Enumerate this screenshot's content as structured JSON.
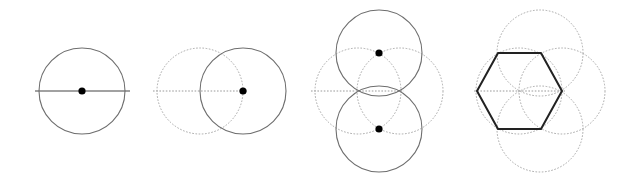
{
  "diagram": {
    "title": "",
    "colors": {
      "solid": "#6e6e6e",
      "dotted": "#a8a8a8",
      "dot": "#000000",
      "hexagon": "#222222"
    },
    "radius": 43,
    "steps": [
      {
        "id": 1,
        "circles": [
          {
            "cx": 82,
            "cy": 91,
            "style": "solid"
          }
        ],
        "lines": [
          {
            "x1": 35,
            "y1": 91,
            "x2": 130,
            "y2": 91,
            "style": "solid"
          }
        ],
        "points": [
          {
            "cx": 82,
            "cy": 91
          }
        ]
      },
      {
        "id": 2,
        "circles": [
          {
            "cx": 200,
            "cy": 91,
            "style": "dotted"
          },
          {
            "cx": 243,
            "cy": 91,
            "style": "solid"
          }
        ],
        "lines": [
          {
            "x1": 153,
            "y1": 91,
            "x2": 247,
            "y2": 91,
            "style": "dotted"
          }
        ],
        "points": [
          {
            "cx": 243,
            "cy": 91
          }
        ]
      },
      {
        "id": 3,
        "circles": [
          {
            "cx": 358,
            "cy": 91,
            "style": "dotted"
          },
          {
            "cx": 400,
            "cy": 91,
            "style": "dotted"
          },
          {
            "cx": 379,
            "cy": 53,
            "style": "solid"
          },
          {
            "cx": 379,
            "cy": 129,
            "style": "solid"
          }
        ],
        "lines": [
          {
            "x1": 311,
            "y1": 91,
            "x2": 404,
            "y2": 91,
            "style": "dotted"
          }
        ],
        "points": [
          {
            "cx": 379,
            "cy": 53
          },
          {
            "cx": 379,
            "cy": 129
          }
        ]
      },
      {
        "id": 4,
        "circles": [
          {
            "cx": 519,
            "cy": 91,
            "style": "dotted"
          },
          {
            "cx": 540,
            "cy": 53,
            "style": "dotted"
          },
          {
            "cx": 562,
            "cy": 91,
            "style": "dotted"
          },
          {
            "cx": 540,
            "cy": 129,
            "style": "dotted"
          }
        ],
        "lines": [
          {
            "x1": 474,
            "y1": 91,
            "x2": 565,
            "y2": 91,
            "style": "dotted"
          }
        ],
        "points": [],
        "hexagon": [
          [
            477,
            91
          ],
          [
            498,
            53
          ],
          [
            541,
            53
          ],
          [
            562,
            91
          ],
          [
            541,
            129
          ],
          [
            498,
            129
          ]
        ]
      }
    ]
  }
}
